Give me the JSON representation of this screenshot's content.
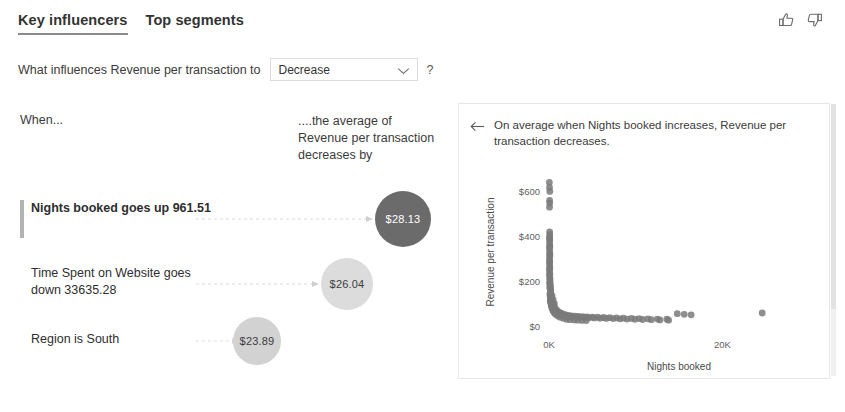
{
  "tabs": [
    {
      "label": "Key influencers",
      "active": true
    },
    {
      "label": "Top segments",
      "active": false
    }
  ],
  "feedback": {
    "thumbs_up": "thumbs-up-icon",
    "thumbs_down": "thumbs-down-icon"
  },
  "question": {
    "prefix": "What influences Revenue per transaction to",
    "selected_value": "Decrease",
    "options": [
      "Increase",
      "Decrease"
    ],
    "help": "?"
  },
  "columns": {
    "when": "When...",
    "average": "....the average of Revenue per transaction decreases by"
  },
  "influencers": [
    {
      "text": "Nights booked goes up 961.51",
      "value": "$28.13",
      "selected": true,
      "bubble_color": "#6b6b6b",
      "text_color": "#ffffff",
      "radius": 28
    },
    {
      "text": "Time Spent on Website goes down 33635.28",
      "value": "$26.04",
      "selected": false,
      "bubble_color": "#dcdcdc",
      "text_color": "#3b3b3b",
      "radius": 26
    },
    {
      "text": "Region is South",
      "value": "$23.89",
      "selected": false,
      "bubble_color": "#d2d2d2",
      "text_color": "#3b3b3b",
      "radius": 24
    }
  ],
  "detail_panel": {
    "back_icon": "back-arrow-icon",
    "description": "On average when Nights booked increases, Revenue per transaction decreases."
  },
  "chart_data": {
    "type": "scatter",
    "title": "",
    "xlabel": "Nights booked",
    "ylabel": "Revenue per transaction",
    "xtick_labels": [
      "0K",
      "20K"
    ],
    "xtick_values": [
      0,
      20000
    ],
    "ytick_labels": [
      "$0",
      "$200",
      "$400",
      "$600"
    ],
    "ytick_values": [
      0,
      200,
      400,
      600
    ],
    "xlim": [
      0,
      30000
    ],
    "ylim": [
      0,
      660
    ],
    "grid": false,
    "legend": false,
    "marker_color": "#7a7a7a",
    "marker_radius": 3.4,
    "points": [
      [
        40,
        640
      ],
      [
        60,
        618
      ],
      [
        90,
        600
      ],
      [
        70,
        560
      ],
      [
        80,
        548
      ],
      [
        60,
        530
      ],
      [
        70,
        420
      ],
      [
        90,
        408
      ],
      [
        60,
        396
      ],
      [
        80,
        382
      ],
      [
        70,
        370
      ],
      [
        90,
        358
      ],
      [
        60,
        346
      ],
      [
        80,
        334
      ],
      [
        70,
        322
      ],
      [
        90,
        310
      ],
      [
        60,
        298
      ],
      [
        80,
        286
      ],
      [
        70,
        274
      ],
      [
        90,
        262
      ],
      [
        60,
        250
      ],
      [
        80,
        238
      ],
      [
        70,
        226
      ],
      [
        90,
        214
      ],
      [
        110,
        200
      ],
      [
        70,
        192
      ],
      [
        130,
        182
      ],
      [
        90,
        172
      ],
      [
        150,
        165
      ],
      [
        200,
        150
      ],
      [
        120,
        140
      ],
      [
        260,
        132
      ],
      [
        180,
        124
      ],
      [
        320,
        118
      ],
      [
        150,
        110
      ],
      [
        420,
        104
      ],
      [
        240,
        98
      ],
      [
        520,
        92
      ],
      [
        300,
        88
      ],
      [
        640,
        84
      ],
      [
        380,
        80
      ],
      [
        760,
        76
      ],
      [
        460,
        72
      ],
      [
        900,
        70
      ],
      [
        560,
        66
      ],
      [
        1050,
        64
      ],
      [
        680,
        62
      ],
      [
        1250,
        60
      ],
      [
        820,
        58
      ],
      [
        1450,
        56
      ],
      [
        980,
        54
      ],
      [
        1700,
        52
      ],
      [
        1150,
        50
      ],
      [
        1950,
        49
      ],
      [
        1350,
        48
      ],
      [
        2250,
        47
      ],
      [
        1550,
        46
      ],
      [
        2600,
        45
      ],
      [
        1800,
        44
      ],
      [
        3000,
        44
      ],
      [
        2100,
        43
      ],
      [
        3400,
        43
      ],
      [
        2450,
        42
      ],
      [
        3900,
        42
      ],
      [
        2800,
        41
      ],
      [
        4400,
        41
      ],
      [
        3200,
        40
      ],
      [
        5000,
        40
      ],
      [
        3600,
        39
      ],
      [
        5600,
        39
      ],
      [
        4100,
        38
      ],
      [
        6300,
        38
      ],
      [
        4600,
        37
      ],
      [
        7000,
        37
      ],
      [
        5200,
        36
      ],
      [
        7800,
        36
      ],
      [
        5900,
        35
      ],
      [
        8600,
        35
      ],
      [
        6600,
        34
      ],
      [
        9500,
        34
      ],
      [
        7400,
        33
      ],
      [
        10400,
        33
      ],
      [
        8200,
        32
      ],
      [
        11400,
        32
      ],
      [
        9000,
        31
      ],
      [
        12500,
        31
      ],
      [
        9900,
        30
      ],
      [
        13600,
        30
      ],
      [
        10800,
        29
      ],
      [
        14800,
        55
      ],
      [
        11800,
        28
      ],
      [
        15600,
        52
      ],
      [
        12800,
        27
      ],
      [
        16400,
        50
      ],
      [
        13800,
        26
      ],
      [
        24600,
        58
      ],
      [
        350,
        135
      ],
      [
        480,
        118
      ],
      [
        620,
        100
      ],
      [
        210,
        160
      ],
      [
        170,
        175
      ],
      [
        130,
        190
      ],
      [
        110,
        210
      ],
      [
        95,
        230
      ],
      [
        85,
        255
      ],
      [
        75,
        285
      ],
      [
        100,
        320
      ],
      [
        88,
        355
      ],
      [
        78,
        390
      ],
      [
        2000,
        30
      ],
      [
        2400,
        28
      ],
      [
        2900,
        27
      ],
      [
        3300,
        26
      ],
      [
        3800,
        25
      ],
      [
        4300,
        24
      ],
      [
        1600,
        35
      ],
      [
        1200,
        40
      ],
      [
        900,
        48
      ],
      [
        700,
        55
      ],
      [
        550,
        62
      ],
      [
        450,
        70
      ],
      [
        380,
        78
      ],
      [
        310,
        86
      ],
      [
        270,
        94
      ],
      [
        230,
        102
      ],
      [
        190,
        112
      ],
      [
        160,
        122
      ],
      [
        140,
        132
      ],
      [
        125,
        145
      ]
    ]
  }
}
